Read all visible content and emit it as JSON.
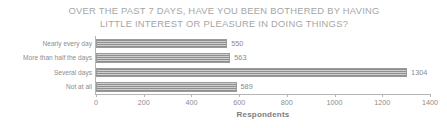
{
  "chart_data": {
    "type": "bar",
    "orientation": "horizontal",
    "title": "OVER THE PAST 7 DAYS, HAVE YOU BEEN BOTHERED BY HAVING\nLITTLE INTEREST OR PLEASURE IN DOING THINGS?",
    "categories": [
      "Nearly every day",
      "More than half the days",
      "Several days",
      "Not at all"
    ],
    "values": [
      550,
      563,
      1304,
      589
    ],
    "value_labels": [
      "550",
      "563",
      "1304",
      "589"
    ],
    "xlabel": "Respondents",
    "ylabel": "",
    "xlim": [
      0,
      1400
    ],
    "xticks": [
      0,
      200,
      400,
      600,
      800,
      1000,
      1200,
      1400
    ],
    "xtick_labels": [
      "0",
      "200",
      "400",
      "600",
      "800",
      "1000",
      "1200",
      "1400"
    ],
    "grid": false,
    "legend": false,
    "bar_color": "#9a9a9a",
    "bar_pattern": "hatched-gray",
    "text_color": "#8a8a8a",
    "background": "#ffffff"
  }
}
